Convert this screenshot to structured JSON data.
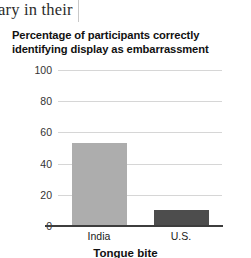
{
  "page_fragment": {
    "text": "ary in their"
  },
  "figure": {
    "caption": "Tongue bite"
  },
  "chart_data": {
    "type": "bar",
    "title": "Percentage of participants correctly identifying display as embarrassment",
    "categories": [
      "India",
      "U.S."
    ],
    "values": [
      53,
      10
    ],
    "series": [
      {
        "name": "Percentage correct",
        "values": [
          53,
          10
        ],
        "colors": [
          "#adadad",
          "#4d4d4d"
        ]
      }
    ],
    "xlabel": "",
    "ylabel": "",
    "ylim": [
      0,
      100
    ],
    "yticks": [
      0,
      20,
      40,
      60,
      80,
      100
    ],
    "ytick_labels": [
      "0",
      "20",
      "40",
      "60",
      "80",
      "100"
    ],
    "grid": true,
    "legend": false,
    "colors": {
      "bar_india": "#adadad",
      "bar_us": "#4d4d4d",
      "gridline": "#d6d6d6",
      "axis": "#3d3d3d"
    }
  }
}
